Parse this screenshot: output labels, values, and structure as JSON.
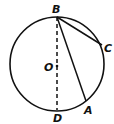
{
  "diagram": {
    "type": "circle-geometry",
    "circle": {
      "cx": 57,
      "cy": 64,
      "r": 47
    },
    "points": {
      "B": {
        "label": "B",
        "x": 57,
        "y": 17
      },
      "C": {
        "label": "C",
        "x": 102,
        "y": 45
      },
      "O": {
        "label": "O",
        "x": 57,
        "y": 66
      },
      "A": {
        "label": "A",
        "x": 86,
        "y": 101
      },
      "D": {
        "label": "D",
        "x": 57,
        "y": 110
      }
    },
    "segments": [
      {
        "from": "B",
        "to": "C",
        "style": "solid"
      },
      {
        "from": "B",
        "to": "A",
        "style": "solid"
      },
      {
        "from": "B",
        "to": "D",
        "style": "dashed"
      }
    ]
  }
}
